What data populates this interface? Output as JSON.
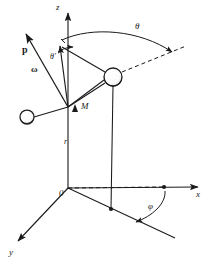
{
  "figure": {
    "kind": "vector-diagram",
    "background_color": "#ffffff",
    "stroke_color": "#1a1a1a"
  },
  "axes": [
    {
      "id": "z",
      "label": "z",
      "label_x": 56,
      "label_y": 4,
      "from": [
        68,
        188
      ],
      "to": [
        68,
        11
      ]
    },
    {
      "id": "x",
      "label": "x",
      "label_x": 196,
      "label_y": 190,
      "from": [
        68,
        188
      ],
      "to": [
        200,
        187
      ]
    },
    {
      "id": "y",
      "label": "y",
      "label_x": 9,
      "label_y": 248,
      "from": [
        68,
        188
      ],
      "to": [
        16,
        243
      ]
    }
  ],
  "points": [
    {
      "id": "origin",
      "label": "0",
      "label_x": 60,
      "label_y": 189,
      "x": 68,
      "y": 188
    },
    {
      "id": "M",
      "label": "M",
      "label_x": 80,
      "label_y": 102,
      "x": 68,
      "y": 107
    },
    {
      "id": "projection-foot",
      "label": "",
      "x": 111,
      "y": 209
    },
    {
      "id": "x-axis-marker",
      "label": "",
      "x": 164,
      "y": 187
    }
  ],
  "vectors": [
    {
      "id": "p",
      "label": "p",
      "label_x": 23,
      "label_y": 45,
      "bold": true,
      "from": [
        68,
        107
      ],
      "to": [
        25,
        33
      ]
    },
    {
      "id": "omega",
      "label": "ω",
      "label_x": 32,
      "label_y": 65,
      "bold": true,
      "from": [
        68,
        107
      ],
      "to": [
        61,
        48
      ]
    }
  ],
  "angles": [
    {
      "id": "theta",
      "label": "θ",
      "label_x": 136,
      "label_y": 23,
      "kind": "arc",
      "description": "polar angle from z-axis to radius vector"
    },
    {
      "id": "theta-prime",
      "label": "θ′",
      "label_x": 50,
      "label_y": 53,
      "kind": "arc",
      "description": "angle between omega and z-axis"
    },
    {
      "id": "phi",
      "label": "φ",
      "label_x": 149,
      "label_y": 203,
      "kind": "arc",
      "description": "azimuthal angle in xy-plane from x-axis"
    }
  ],
  "lengths": [
    {
      "id": "r",
      "label": "r",
      "label_x": 64,
      "label_y": 138,
      "description": "radial distance from origin to M"
    }
  ],
  "spheres": [
    {
      "id": "observation-sphere",
      "cx": 113,
      "cy": 77,
      "r": 9,
      "description": "field point on radius vector"
    },
    {
      "id": "charge-sphere",
      "cx": 27,
      "cy": 117,
      "r": 7,
      "description": "charge at end of dipole axis"
    }
  ]
}
